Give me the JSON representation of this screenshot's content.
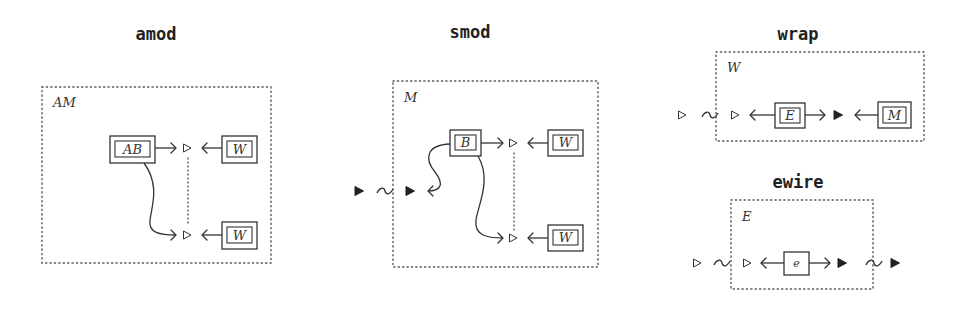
{
  "panels": {
    "amod": {
      "title": "amod",
      "frame_label": "AM",
      "source_box": "AB",
      "target_boxes": [
        "W",
        "W"
      ]
    },
    "smod": {
      "title": "smod",
      "frame_label": "M",
      "source_box": "B",
      "target_boxes": [
        "W",
        "W"
      ]
    },
    "wrap": {
      "title": "wrap",
      "frame_label": "W",
      "boxes": [
        "E",
        "M"
      ]
    },
    "ewire": {
      "title": "ewire",
      "frame_label": "E",
      "box": "e"
    }
  },
  "icons": {
    "hollow_port": "hollow-triangle-icon",
    "filled_port": "filled-triangle-icon",
    "link": "tilde-icon"
  },
  "colors": {
    "stroke": "#333333",
    "frame": "#555555",
    "background": "#ffffff"
  }
}
